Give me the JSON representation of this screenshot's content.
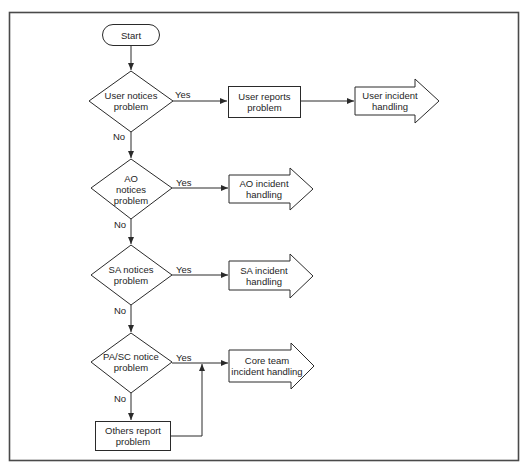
{
  "diagram": {
    "type": "flowchart",
    "colors": {
      "stroke": "#2a2a2a",
      "frame": "#4a4a4a",
      "fill": "#ffffff",
      "text": "#1e1e1e"
    },
    "start": {
      "label": "Start"
    },
    "decisions": [
      {
        "id": "user",
        "label": "User notices\nproblem"
      },
      {
        "id": "ao",
        "label": "AO\nnotices\nproblem"
      },
      {
        "id": "sa",
        "label": "SA notices\nproblem"
      },
      {
        "id": "pasc",
        "label": "PA/SC notice\nproblem"
      }
    ],
    "processes": [
      {
        "id": "user_reports",
        "label": "User reports\nproblem"
      },
      {
        "id": "others_report",
        "label": "Others report\nproblem"
      }
    ],
    "outcomes": [
      {
        "id": "user_handling",
        "label": "User incident\nhandling"
      },
      {
        "id": "ao_handling",
        "label": "AO incident\nhandling"
      },
      {
        "id": "sa_handling",
        "label": "SA incident\nhandling"
      },
      {
        "id": "core_handling",
        "label": "Core team\nincident handling"
      }
    ],
    "edge_labels": {
      "yes": "Yes",
      "no": "No"
    },
    "edges": [
      {
        "from": "Start",
        "to": "User notices problem",
        "label": ""
      },
      {
        "from": "User notices problem",
        "to": "User reports problem",
        "label": "Yes"
      },
      {
        "from": "User reports problem",
        "to": "User incident handling",
        "label": ""
      },
      {
        "from": "User notices problem",
        "to": "AO notices problem",
        "label": "No"
      },
      {
        "from": "AO notices problem",
        "to": "AO incident handling",
        "label": "Yes"
      },
      {
        "from": "AO notices problem",
        "to": "SA notices problem",
        "label": "No"
      },
      {
        "from": "SA notices problem",
        "to": "SA incident handling",
        "label": "Yes"
      },
      {
        "from": "SA notices problem",
        "to": "PA/SC notice problem",
        "label": "No"
      },
      {
        "from": "PA/SC notice problem",
        "to": "Core team incident handling",
        "label": "Yes"
      },
      {
        "from": "PA/SC notice problem",
        "to": "Others report problem",
        "label": "No"
      },
      {
        "from": "Others report problem",
        "to": "Core team incident handling",
        "label": ""
      }
    ]
  }
}
